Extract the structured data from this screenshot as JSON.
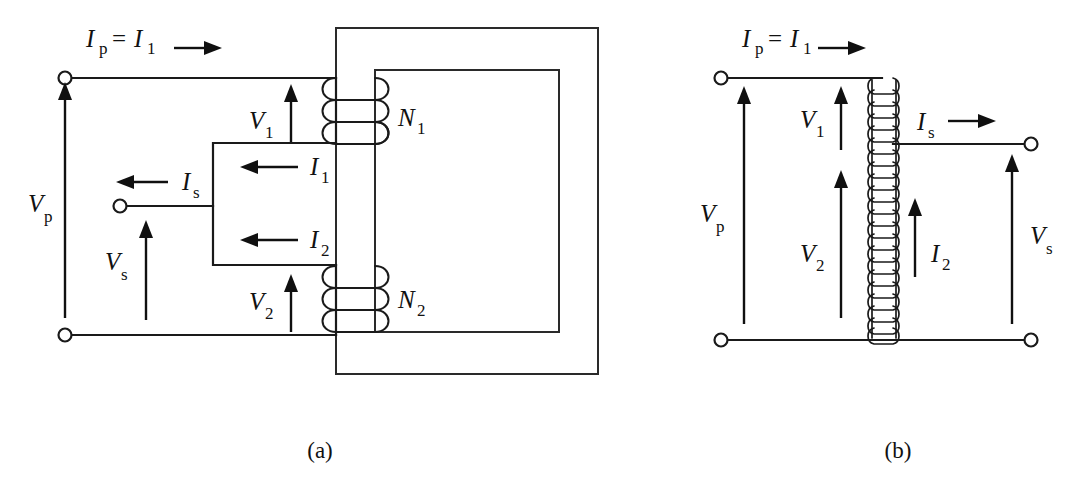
{
  "figure": {
    "background_color": "#ffffff",
    "line_color": "#1a1a1a",
    "text_color": "#111111",
    "captions": [
      {
        "key": "a",
        "text": "(a)"
      },
      {
        "key": "b",
        "text": "(b)"
      }
    ]
  },
  "panel_a": {
    "caption": "(a)",
    "description": "Two-winding transformer with magnetic core, primary winding N1 and secondary winding N2",
    "labels": {
      "ip_eq_i1_var": "I",
      "ip_eq_i1_sub1": "p",
      "ip_eq_i1_eq": "=",
      "ip_eq_i1_var2": "I",
      "ip_eq_i1_sub2": "1",
      "vp_var": "V",
      "vp_sub": "p",
      "vs_var": "V",
      "vs_sub": "s",
      "v1_var": "V",
      "v1_sub": "1",
      "v2_var": "V",
      "v2_sub": "2",
      "is_var": "I",
      "is_sub": "s",
      "i1_var": "I",
      "i1_sub": "1",
      "i2_var": "I",
      "i2_sub": "2",
      "n1_var": "N",
      "n1_sub": "1",
      "n2_var": "N",
      "n2_sub": "2"
    },
    "quantities": [
      {
        "symbol": "Ip = I1",
        "name": "primary current",
        "direction": "right"
      },
      {
        "symbol": "Vp",
        "name": "primary voltage",
        "direction": "up"
      },
      {
        "symbol": "Vs",
        "name": "secondary voltage",
        "direction": "up"
      },
      {
        "symbol": "V1",
        "name": "winding 1 voltage",
        "direction": "up"
      },
      {
        "symbol": "V2",
        "name": "winding 2 voltage",
        "direction": "up"
      },
      {
        "symbol": "Is",
        "name": "secondary current",
        "direction": "left"
      },
      {
        "symbol": "I1",
        "name": "winding 1 current",
        "direction": "left"
      },
      {
        "symbol": "I2",
        "name": "winding 2 current",
        "direction": "left"
      },
      {
        "symbol": "N1",
        "name": "primary turns",
        "direction": "none"
      },
      {
        "symbol": "N2",
        "name": "secondary turns",
        "direction": "none"
      }
    ]
  },
  "panel_b": {
    "caption": "(b)",
    "description": "Autotransformer representation with single tapped coil",
    "labels": {
      "ip_eq_i1_var": "I",
      "ip_eq_i1_sub1": "p",
      "ip_eq_i1_eq": "=",
      "ip_eq_i1_var2": "I",
      "ip_eq_i1_sub2": "1",
      "vp_var": "V",
      "vp_sub": "p",
      "vs_var": "V",
      "vs_sub": "s",
      "v1_var": "V",
      "v1_sub": "1",
      "v2_var": "V",
      "v2_sub": "2",
      "is_var": "I",
      "is_sub": "s",
      "i2_var": "I",
      "i2_sub": "2"
    },
    "quantities": [
      {
        "symbol": "Ip = I1",
        "name": "primary current",
        "direction": "right"
      },
      {
        "symbol": "Vp",
        "name": "primary voltage",
        "direction": "up"
      },
      {
        "symbol": "V1",
        "name": "upper section voltage",
        "direction": "up"
      },
      {
        "symbol": "V2",
        "name": "lower section voltage",
        "direction": "up"
      },
      {
        "symbol": "Is",
        "name": "secondary current",
        "direction": "right"
      },
      {
        "symbol": "I2",
        "name": "lower section current",
        "direction": "up"
      },
      {
        "symbol": "Vs",
        "name": "secondary voltage",
        "direction": "up"
      }
    ]
  }
}
